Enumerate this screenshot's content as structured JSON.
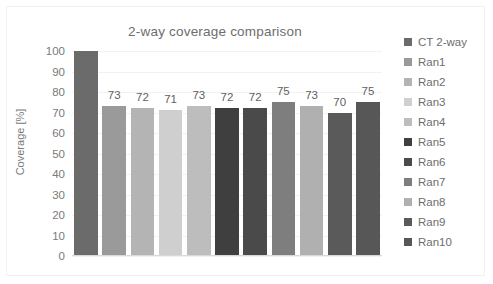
{
  "chart_data": {
    "type": "bar",
    "title": "2-way coverage comparison",
    "xlabel": "",
    "ylabel": "Coverage [%]",
    "ylim": [
      0,
      100
    ],
    "ytick_step": 10,
    "yticks": [
      "100",
      "90",
      "80",
      "70",
      "60",
      "50",
      "40",
      "30",
      "20",
      "10",
      "0"
    ],
    "grid": true,
    "legend_position": "right",
    "categories": [
      "CT 2-way",
      "Ran1",
      "Ran2",
      "Ran3",
      "Ran4",
      "Ran5",
      "Ran6",
      "Ran7",
      "Ran8",
      "Ran9",
      "Ran10"
    ],
    "values": [
      100,
      73,
      72,
      71,
      73,
      72,
      72,
      75,
      73,
      70,
      75
    ],
    "data_labels": [
      "",
      "73",
      "72",
      "71",
      "73",
      "72",
      "72",
      "75",
      "73",
      "70",
      "75"
    ],
    "colors": [
      "#6b6b6b",
      "#9a9a9a",
      "#b4b4b4",
      "#cfcfcf",
      "#bdbdbd",
      "#3f3f3f",
      "#4a4a4a",
      "#7e7e7e",
      "#b0b0b0",
      "#5a5a5a",
      "#575757"
    ]
  },
  "legend": {
    "items": [
      {
        "label": "CT 2-way",
        "color": "#6b6b6b"
      },
      {
        "label": "Ran1",
        "color": "#9a9a9a"
      },
      {
        "label": "Ran2",
        "color": "#b4b4b4"
      },
      {
        "label": "Ran3",
        "color": "#cfcfcf"
      },
      {
        "label": "Ran4",
        "color": "#bdbdbd"
      },
      {
        "label": "Ran5",
        "color": "#3f3f3f"
      },
      {
        "label": "Ran6",
        "color": "#4a4a4a"
      },
      {
        "label": "Ran7",
        "color": "#7e7e7e"
      },
      {
        "label": "Ran8",
        "color": "#b0b0b0"
      },
      {
        "label": "Ran9",
        "color": "#5a5a5a"
      },
      {
        "label": "Ran10",
        "color": "#575757"
      }
    ]
  }
}
